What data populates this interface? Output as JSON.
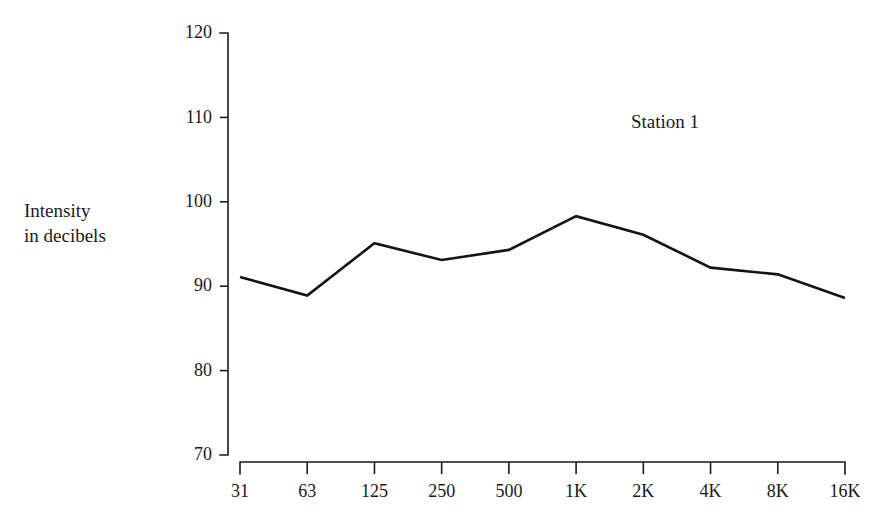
{
  "chart_data": {
    "type": "line",
    "title": "",
    "subtitle": "",
    "xlabel": "",
    "ylabel": "Intensity\nin decibels",
    "annotations": [
      {
        "text": "Station 1",
        "x": "1K",
        "y": 110
      }
    ],
    "legend": {
      "position": "inline-annotation",
      "entries": [
        "Station 1"
      ]
    },
    "grid": false,
    "categories": [
      "31",
      "63",
      "125",
      "250",
      "500",
      "1K",
      "2K",
      "4K",
      "8K",
      "16K"
    ],
    "x_tick_labels": [
      "31",
      "63",
      "125",
      "250",
      "500",
      "1K",
      "2K",
      "4K",
      "8K",
      "16K"
    ],
    "y_tick_labels": [
      "70",
      "80",
      "90",
      "100",
      "110",
      "120"
    ],
    "y_ticks": [
      70,
      80,
      90,
      100,
      110,
      120
    ],
    "ylim": [
      70,
      120
    ],
    "series": [
      {
        "name": "Station 1",
        "color": "#141414",
        "values": [
          91.1,
          88.9,
          95.1,
          93.1,
          94.3,
          98.3,
          96.1,
          92.2,
          91.4,
          88.6
        ]
      }
    ]
  },
  "figure": {
    "background_color": "#ffffff",
    "axis_color": "#1a1a1a",
    "y_axis_title": "Intensity\nin decibels",
    "series_label": "Station 1"
  }
}
